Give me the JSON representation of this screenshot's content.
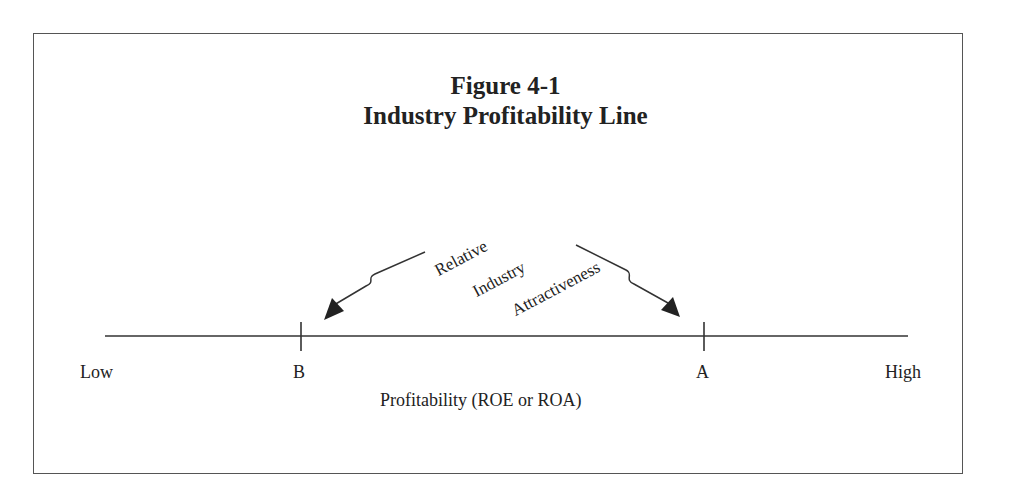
{
  "figure": {
    "title_line1": "Figure 4-1",
    "title_line2": "Industry Profitability Line"
  },
  "axis": {
    "low_label": "Low",
    "high_label": "High",
    "caption": "Profitability (ROE or ROA)",
    "points": [
      {
        "label": "B",
        "position": "lower profitability"
      },
      {
        "label": "A",
        "position": "higher profitability"
      }
    ]
  },
  "annotation": {
    "lines": [
      "Relative",
      "Industry",
      "Attractiveness"
    ]
  },
  "colors": {
    "stroke": "#333333",
    "frame": "#555555",
    "text": "#222222"
  }
}
